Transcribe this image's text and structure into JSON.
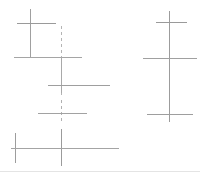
{
  "canvas": {
    "width": 200,
    "height": 174,
    "background_color": "#ffffff",
    "title": "faint-crosshair-line-drawing"
  },
  "style": {
    "line_color_dark": "#8d8d8d",
    "line_color_mid": "#a8a8a8",
    "line_color_light": "#c2c2c2",
    "line_color_faint": "#d6d6d6",
    "stroke_width": 1,
    "dash_pattern": "3 3"
  },
  "shapes": [
    {
      "name": "top-left-vertical-stem",
      "type": "line",
      "orientation": "vertical",
      "x1": 30,
      "y1": 9,
      "x2": 30,
      "y2": 58,
      "color": "#a0a0a0",
      "width": 1,
      "dashed": false
    },
    {
      "name": "top-left-upper-crossbar",
      "type": "line",
      "orientation": "horizontal",
      "x1": 17,
      "y1": 23,
      "x2": 56,
      "y2": 23,
      "color": "#9a9a9a",
      "width": 1,
      "dashed": false
    },
    {
      "name": "top-left-baseline-crossbar",
      "type": "line",
      "orientation": "horizontal",
      "x1": 14,
      "y1": 57,
      "x2": 82,
      "y2": 57,
      "color": "#a5a5a5",
      "width": 1,
      "dashed": false
    },
    {
      "name": "center-dashed-vertical",
      "type": "line",
      "orientation": "vertical",
      "x1": 61,
      "y1": 26,
      "x2": 61,
      "y2": 96,
      "color": "#b4b4b4",
      "width": 1,
      "dashed": true
    },
    {
      "name": "center-vertical-solid-segment",
      "type": "line",
      "orientation": "vertical",
      "x1": 61,
      "y1": 57,
      "x2": 61,
      "y2": 93,
      "color": "#a9a9a9",
      "width": 1,
      "dashed": false
    },
    {
      "name": "center-long-crossbar",
      "type": "line",
      "orientation": "horizontal",
      "x1": 48,
      "y1": 85,
      "x2": 110,
      "y2": 85,
      "color": "#9e9e9e",
      "width": 1,
      "dashed": false
    },
    {
      "name": "mid-left-vertical-stub",
      "type": "line",
      "orientation": "vertical",
      "x1": 61,
      "y1": 100,
      "x2": 61,
      "y2": 124,
      "color": "#b0b0b0",
      "width": 1,
      "dashed": true
    },
    {
      "name": "mid-left-crossbar",
      "type": "line",
      "orientation": "horizontal",
      "x1": 38,
      "y1": 113,
      "x2": 87,
      "y2": 113,
      "color": "#a2a2a2",
      "width": 1,
      "dashed": false
    },
    {
      "name": "bottom-left-short-vertical",
      "type": "line",
      "orientation": "vertical",
      "x1": 15,
      "y1": 133,
      "x2": 15,
      "y2": 163,
      "color": "#9d9d9d",
      "width": 1,
      "dashed": false
    },
    {
      "name": "bottom-center-vertical",
      "type": "line",
      "orientation": "vertical",
      "x1": 61,
      "y1": 129,
      "x2": 61,
      "y2": 166,
      "color": "#9b9b9b",
      "width": 1,
      "dashed": false
    },
    {
      "name": "bottom-long-crossbar",
      "type": "line",
      "orientation": "horizontal",
      "x1": 11,
      "y1": 148,
      "x2": 119,
      "y2": 148,
      "color": "#a4a4a4",
      "width": 1,
      "dashed": false
    },
    {
      "name": "right-cluster-main-vertical",
      "type": "line",
      "orientation": "vertical",
      "x1": 169,
      "y1": 11,
      "x2": 169,
      "y2": 122,
      "color": "#9c9c9c",
      "width": 1,
      "dashed": false
    },
    {
      "name": "right-cluster-top-crossbar",
      "type": "line",
      "orientation": "horizontal",
      "x1": 156,
      "y1": 22,
      "x2": 187,
      "y2": 22,
      "color": "#9a9a9a",
      "width": 1,
      "dashed": false
    },
    {
      "name": "right-cluster-middle-crossbar",
      "type": "line",
      "orientation": "horizontal",
      "x1": 143,
      "y1": 58,
      "x2": 197,
      "y2": 58,
      "color": "#a0a0a0",
      "width": 1,
      "dashed": false
    },
    {
      "name": "right-cluster-bottom-crossbar",
      "type": "line",
      "orientation": "horizontal",
      "x1": 147,
      "y1": 114,
      "x2": 193,
      "y2": 114,
      "color": "#9e9e9e",
      "width": 1,
      "dashed": false
    },
    {
      "name": "bottom-edge-faint-rule",
      "type": "line",
      "orientation": "horizontal",
      "x1": 0,
      "y1": 171,
      "x2": 200,
      "y2": 171,
      "color": "#e4e4e4",
      "width": 1,
      "dashed": false
    }
  ]
}
